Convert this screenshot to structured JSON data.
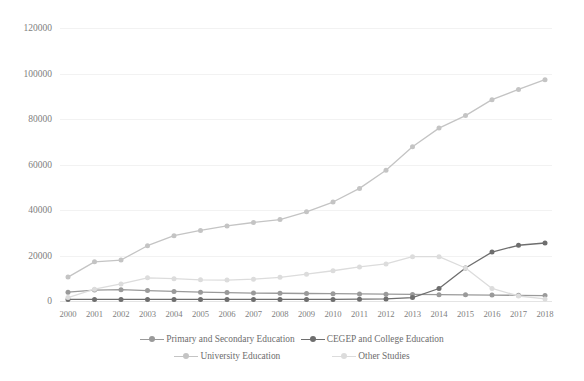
{
  "top_artifact_text": "",
  "chart_data": {
    "type": "line",
    "title": "",
    "subtitle": "",
    "xlabel": "",
    "ylabel": "",
    "grid": true,
    "legend_position": "bottom",
    "ylim": [
      0,
      120000
    ],
    "ytick_values": [
      0,
      20000,
      40000,
      60000,
      80000,
      100000,
      120000
    ],
    "ytick_labels": [
      "0",
      "20000",
      "40000",
      "60000",
      "80000",
      "100000",
      "120000"
    ],
    "categories": [
      "2000",
      "2001",
      "2002",
      "2003",
      "2004",
      "2005",
      "2006",
      "2007",
      "2008",
      "2009",
      "2010",
      "2011",
      "2012",
      "2013",
      "2014",
      "2015",
      "2016",
      "2017",
      "2018"
    ],
    "series": [
      {
        "name": "Primary and Secondary Education",
        "color": "#9a9a9a",
        "marker": "circle",
        "values": [
          3900,
          4800,
          5000,
          4600,
          4200,
          3900,
          3700,
          3500,
          3400,
          3300,
          3200,
          3100,
          3000,
          2900,
          2800,
          2700,
          2600,
          2500,
          2400
        ]
      },
      {
        "name": "CEGEP and College Education",
        "color": "#6e6e6e",
        "marker": "circle",
        "values": [
          700,
          700,
          700,
          700,
          700,
          700,
          700,
          700,
          700,
          700,
          700,
          800,
          900,
          1500,
          5500,
          14500,
          21500,
          24500,
          25500
        ]
      },
      {
        "name": "University Education",
        "color": "#c4c4c4",
        "marker": "circle",
        "values": [
          10500,
          17200,
          18000,
          24300,
          28700,
          31000,
          33000,
          34500,
          35800,
          39200,
          43500,
          49500,
          57500,
          67800,
          76000,
          81500,
          88500,
          93000,
          97300
        ]
      },
      {
        "name": "Other Studies",
        "color": "#dcdcdc",
        "marker": "circle",
        "values": [
          1500,
          5200,
          7500,
          10200,
          9800,
          9300,
          9200,
          9600,
          10400,
          11800,
          13300,
          15000,
          16300,
          19500,
          19500,
          14500,
          5500,
          2200,
          900
        ]
      }
    ]
  },
  "legend": {
    "rows": [
      [
        {
          "label": "Primary and Secondary Education",
          "color": "#9a9a9a"
        },
        {
          "label": "CEGEP and College Education",
          "color": "#6e6e6e"
        }
      ],
      [
        {
          "label": "University Education",
          "color": "#c4c4c4"
        },
        {
          "label": "Other Studies",
          "color": "#dcdcdc"
        }
      ]
    ]
  }
}
